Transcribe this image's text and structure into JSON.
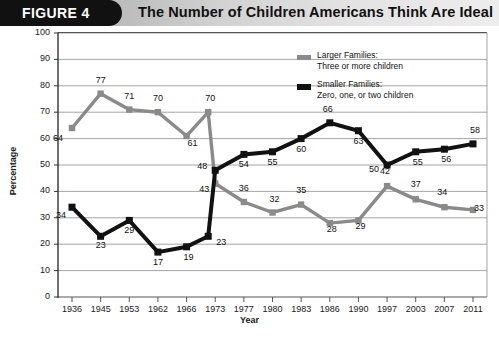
{
  "header": {
    "tab_label": "FIGURE 4",
    "title": "The Number of Children Americans Think Are Ideal"
  },
  "legend": {
    "position": "top-right",
    "items": [
      {
        "name": "larger-families",
        "line1": "Larger Families:",
        "line2": "Three or more children",
        "color": "#8a8a8a"
      },
      {
        "name": "smaller-families",
        "line1": "Smaller Families:",
        "line2": "Zero, one, or two children",
        "color": "#111111"
      }
    ]
  },
  "chart_data": {
    "type": "line",
    "title": "The Number of Children Americans Think Are Ideal",
    "xlabel": "Year",
    "ylabel": "Percentage",
    "ylim": [
      0,
      100
    ],
    "yticks": [
      0,
      10,
      20,
      30,
      40,
      50,
      60,
      70,
      80,
      90,
      100
    ],
    "ytick_labels": [
      "0",
      "10",
      "20",
      "30",
      "40",
      "50",
      "60",
      "70",
      "80",
      "90",
      "100"
    ],
    "grid": true,
    "categories": [
      "1936",
      "1945",
      "1953",
      "1962",
      "1966",
      "1973",
      "1977",
      "1980",
      "1983",
      "1986",
      "1990",
      "1997",
      "2003",
      "2007",
      "2011"
    ],
    "series": [
      {
        "name": "Larger Families: Three or more children",
        "color": "#8a8a8a",
        "values": [
          64,
          77,
          71,
          70,
          61,
          43,
          36,
          32,
          35,
          28,
          29,
          42,
          37,
          34,
          33
        ],
        "labels": [
          "64",
          "77",
          "71",
          "70",
          "61",
          "43",
          "36",
          "32",
          "35",
          "28",
          "29",
          "42",
          "37",
          "34",
          "33"
        ],
        "peak_annotation": {
          "label": "70",
          "value": 70,
          "note": "pre-1973 peak on rising segment"
        }
      },
      {
        "name": "Smaller Families: Zero, one, or two children",
        "color": "#111111",
        "values": [
          34,
          23,
          29,
          17,
          19,
          48,
          54,
          55,
          60,
          66,
          63,
          50,
          55,
          56,
          58
        ],
        "labels": [
          "34",
          "23",
          "29",
          "17",
          "19",
          "48",
          "54",
          "55",
          "60",
          "66",
          "63",
          "50",
          "55",
          "56",
          "58"
        ],
        "extra_annotation": {
          "label": "23",
          "value": 23,
          "note": "point between 1966 and 1973 on rising segment"
        }
      }
    ]
  }
}
